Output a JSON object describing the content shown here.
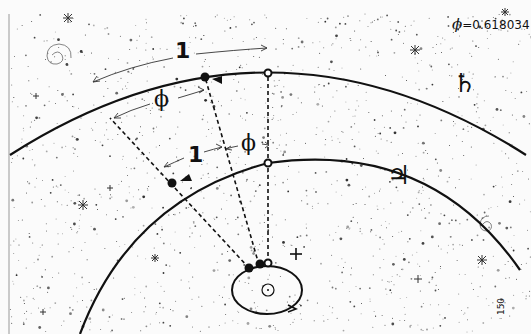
{
  "diagram": {
    "title_constant": {
      "symbol": "ϕ",
      "text": "=0.618034"
    },
    "labels": {
      "outer_one": "1",
      "outer_phi": "ϕ",
      "inner_one": "1",
      "inner_phi": "ϕ",
      "saturn_symbol": "♄",
      "jupiter_symbol": "♃",
      "page_number": "150"
    },
    "orbits": [
      {
        "name": "Saturn orbit",
        "role": "outer"
      },
      {
        "name": "Jupiter orbit",
        "role": "middle"
      },
      {
        "name": "Earth orbit",
        "role": "inner-ellipse"
      }
    ],
    "colors": {
      "ink": "#111111",
      "background": "#fbfbfb",
      "star": "#222222"
    }
  }
}
